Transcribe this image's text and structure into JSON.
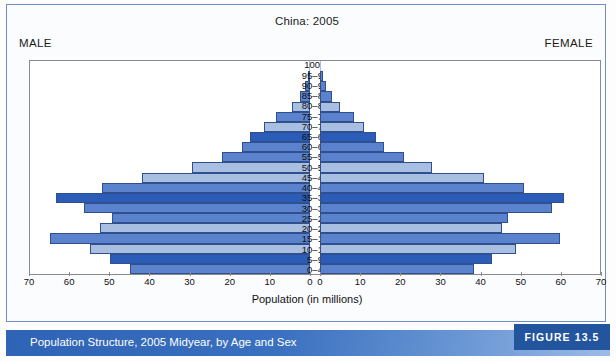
{
  "figure": {
    "title": "China: 2005",
    "male_label": "MALE",
    "female_label": "FEMALE",
    "axis_title": "Population (in millions)",
    "caption": "Population Structure, 2005 Midyear, by Age and Sex",
    "figure_number": "FIGURE 13.5"
  },
  "colors": {
    "dark_blue": "#2a5cb8",
    "medium_blue": "#5b82cc",
    "light_blue": "#a9bfe2",
    "bar_outline": "#2f4f8f",
    "band_blue": "#2f63b5",
    "badge_blue": "#23559f"
  },
  "chart_data": {
    "type": "bar",
    "subtype": "population-pyramid",
    "title": "China: 2005",
    "xlabel": "Population (in millions)",
    "ylabel": "",
    "categories": [
      "100+",
      "95–99",
      "90–94",
      "85–89",
      "80–84",
      "75–79",
      "70–74",
      "65–69",
      "60–64",
      "55–59",
      "50–54",
      "45–49",
      "40–44",
      "35–39",
      "30–34",
      "25–29",
      "20–24",
      "15–19",
      "10–14",
      "5–9",
      "0–4"
    ],
    "xlim": [
      0,
      70
    ],
    "xticks_left": [
      70,
      60,
      50,
      40,
      30,
      20,
      10,
      0
    ],
    "xticks_right": [
      0,
      10,
      20,
      30,
      40,
      50,
      60,
      70
    ],
    "grid": false,
    "legend": "none",
    "series": [
      {
        "name": "MALE",
        "side": "left",
        "values": [
          0.1,
          0.5,
          1.2,
          2.6,
          4.5,
          8.5,
          11.5,
          15.0,
          17.0,
          22.0,
          29.5,
          42.0,
          52.0,
          63.5,
          56.5,
          49.5,
          52.5,
          65.0,
          55.0,
          50.0,
          45.0
        ]
      },
      {
        "name": "FEMALE",
        "side": "right",
        "values": [
          0.15,
          0.7,
          1.6,
          3.1,
          5.0,
          8.5,
          11.0,
          14.0,
          16.0,
          21.0,
          28.0,
          41.0,
          51.0,
          61.0,
          58.0,
          47.0,
          45.5,
          60.0,
          49.0,
          43.0,
          38.5
        ]
      }
    ],
    "bar_shades": [
      "light_blue",
      "medium_blue",
      "medium_blue",
      "medium_blue",
      "light_blue",
      "medium_blue",
      "light_blue",
      "dark_blue",
      "medium_blue",
      "medium_blue",
      "light_blue",
      "light_blue",
      "medium_blue",
      "dark_blue",
      "medium_blue",
      "medium_blue",
      "light_blue",
      "medium_blue",
      "light_blue",
      "dark_blue",
      "medium_blue"
    ]
  }
}
